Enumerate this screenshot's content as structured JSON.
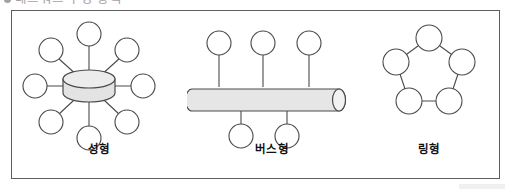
{
  "heading": {
    "bullet": "●",
    "text": "네트워크 구성 방식"
  },
  "figure": {
    "border_color": "#5d5d5d",
    "background": "#ffffff",
    "node_fill": "#ffffff",
    "node_stroke": "#4a4a4a",
    "device_fill": "#e3e3e3",
    "device_stroke": "#4a4a4a",
    "link_stroke": "#4a4a4a"
  },
  "panels": [
    {
      "id": "star",
      "caption": "성형",
      "topology_type": "star",
      "hub_shape": "cylinder-disk",
      "node_count": 8,
      "nodes": [
        {
          "label": "",
          "angle_deg": 90
        },
        {
          "label": "",
          "angle_deg": 45
        },
        {
          "label": "",
          "angle_deg": 0
        },
        {
          "label": "",
          "angle_deg": -45
        },
        {
          "label": "",
          "angle_deg": -90
        },
        {
          "label": "",
          "angle_deg": -135
        },
        {
          "label": "",
          "angle_deg": 180
        },
        {
          "label": "",
          "angle_deg": 135
        }
      ]
    },
    {
      "id": "bus",
      "caption": "버스형",
      "topology_type": "bus",
      "backbone_shape": "horizontal-cylinder",
      "node_count": 5,
      "nodes_above": 3,
      "nodes_below": 2
    },
    {
      "id": "ring",
      "caption": "링형",
      "topology_type": "ring",
      "node_count": 5,
      "arrangement": "pentagon"
    }
  ]
}
